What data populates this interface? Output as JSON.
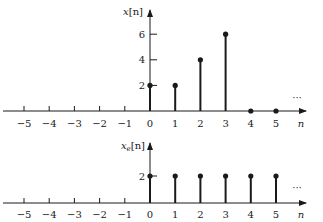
{
  "chart_data": [
    {
      "type": "stem",
      "title": "",
      "xlabel": "n",
      "ylabel": "x[n]",
      "x_ticks": [
        -5,
        -4,
        -3,
        -2,
        -1,
        0,
        1,
        2,
        3,
        4,
        5
      ],
      "y_ticks": [
        2,
        4,
        6
      ],
      "x": [
        0,
        1,
        2,
        3,
        4,
        5
      ],
      "values": [
        2,
        2,
        4,
        6,
        0,
        0
      ],
      "continuation": "...",
      "xlim": [
        -5.5,
        6
      ],
      "ylim": [
        0,
        8
      ],
      "grid": false
    },
    {
      "type": "stem",
      "title": "",
      "xlabel": "n",
      "ylabel": "x_e[n]",
      "x_ticks": [
        -5,
        -4,
        -3,
        -2,
        -1,
        0,
        1,
        2,
        3,
        4,
        5
      ],
      "y_ticks": [
        2
      ],
      "x": [
        0,
        1,
        2,
        3,
        4,
        5
      ],
      "values": [
        2,
        2,
        2,
        2,
        2,
        2
      ],
      "continuation": "...",
      "xlim": [
        -5.5,
        6
      ],
      "ylim": [
        0,
        3
      ],
      "grid": false
    }
  ],
  "plots": [
    {
      "ylabel_main": "x",
      "ylabel_sub": "",
      "ylabel_tail": "[n]",
      "xlabel": "n",
      "ellipsis": "···",
      "ytick_labels": [
        "2",
        "4",
        "6"
      ],
      "xtick_labels": [
        "−5",
        "−4",
        "−3",
        "−2",
        "−1",
        "0",
        "1",
        "2",
        "3",
        "4",
        "5"
      ]
    },
    {
      "ylabel_main": "x",
      "ylabel_sub": "e",
      "ylabel_tail": "[n]",
      "xlabel": "n",
      "ellipsis": "···",
      "ytick_labels": [
        "2"
      ],
      "xtick_labels": [
        "−5",
        "−4",
        "−3",
        "−2",
        "−1",
        "0",
        "1",
        "2",
        "3",
        "4",
        "5"
      ]
    }
  ],
  "colors": {
    "ink": "#1a1a1a",
    "background": "#ffffff"
  }
}
